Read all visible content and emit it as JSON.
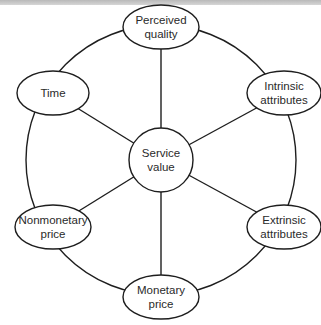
{
  "diagram": {
    "type": "hub-and-ring",
    "center": {
      "id": "service-value",
      "lines": [
        "Service",
        "value"
      ],
      "cx": 161,
      "cy": 160,
      "r": 32
    },
    "nodes": [
      {
        "id": "perceived-quality",
        "lines": [
          "Perceived",
          "quality"
        ],
        "cx": 161,
        "cy": 27,
        "rx": 38,
        "ry": 22
      },
      {
        "id": "intrinsic-attributes",
        "lines": [
          "Intrinsic",
          "attributes"
        ],
        "cx": 284,
        "cy": 93,
        "rx": 37,
        "ry": 22
      },
      {
        "id": "extrinsic-attributes",
        "lines": [
          "Extrinsic",
          "attributes"
        ],
        "cx": 284,
        "cy": 227,
        "rx": 37,
        "ry": 22
      },
      {
        "id": "monetary-price",
        "lines": [
          "Monetary",
          "price"
        ],
        "cx": 161,
        "cy": 297,
        "rx": 38,
        "ry": 22
      },
      {
        "id": "nonmonetary-price",
        "lines": [
          "Nonmonetary",
          "price"
        ],
        "cx": 53,
        "cy": 227,
        "rx": 38,
        "ry": 22
      },
      {
        "id": "time",
        "lines": [
          "Time"
        ],
        "cx": 53,
        "cy": 93,
        "rx": 36,
        "ry": 22
      }
    ],
    "ring": {
      "cx": 161,
      "cy": 160,
      "r": 135
    },
    "edges": [
      [
        "service-value",
        "perceived-quality"
      ],
      [
        "service-value",
        "intrinsic-attributes"
      ],
      [
        "service-value",
        "extrinsic-attributes"
      ],
      [
        "service-value",
        "monetary-price"
      ],
      [
        "service-value",
        "nonmonetary-price"
      ],
      [
        "service-value",
        "time"
      ]
    ],
    "colors": {
      "stroke": "#1e1e1e",
      "text": "#2a2a2a",
      "background": "#ffffff"
    }
  }
}
